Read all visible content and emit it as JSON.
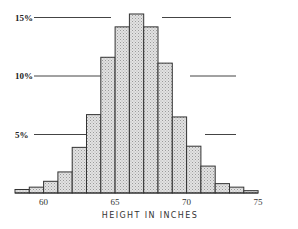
{
  "chart_data": {
    "type": "bar",
    "title": "",
    "xlabel": "HEIGHT IN INCHES",
    "ylabel": "",
    "categories": [
      "58-59",
      "59-60",
      "60-61",
      "61-62",
      "62-63",
      "63-64",
      "64-65",
      "65-66",
      "66-67",
      "67-68",
      "68-69",
      "69-70",
      "70-71",
      "71-72",
      "72-73",
      "73-74",
      "74-75"
    ],
    "bin_edges": [
      58,
      59,
      60,
      61,
      62,
      63,
      64,
      65,
      66,
      67,
      68,
      69,
      70,
      71,
      72,
      73,
      74,
      75
    ],
    "values": [
      0.3,
      0.5,
      1.0,
      1.8,
      3.9,
      6.7,
      11.6,
      14.2,
      15.3,
      14.2,
      11.1,
      6.5,
      4.0,
      2.3,
      0.8,
      0.5,
      0.2
    ],
    "unit": "%",
    "xticks": [
      60,
      65,
      70,
      75
    ],
    "xtick_labels": [
      "60",
      "65",
      "70",
      "75"
    ],
    "yticks": [
      5,
      10,
      15
    ],
    "ytick_labels": [
      "5%",
      "10%",
      "15%"
    ],
    "ylim": [
      0,
      16
    ],
    "grid": "partial horizontal reference lines at 5%, 10%, 15%",
    "legend": null,
    "style": {
      "bar_fill": "#d4d4d4",
      "bar_edge": "#333333",
      "hatch": "stipple"
    }
  }
}
